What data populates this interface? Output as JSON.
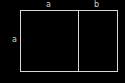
{
  "diagram": {
    "type": "rectangle-partition",
    "labels": {
      "top_left_segment": "a",
      "top_right_segment": "b",
      "left_side": "a"
    },
    "colors": {
      "background": "#000000",
      "stroke": "#d8d8d8",
      "text": "#d0d0d0"
    }
  }
}
